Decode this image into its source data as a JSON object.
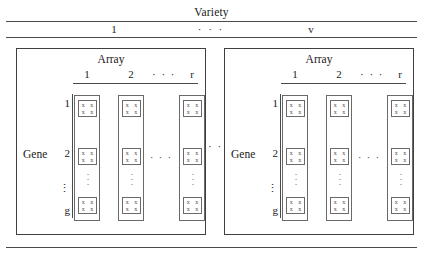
{
  "figure": {
    "top_heading": "Variety",
    "variety_columns": [
      "1",
      "· · ·",
      "v"
    ],
    "between_panels_ellipsis": "· · ·",
    "gene_axis_label": "Gene",
    "gene_ticks": [
      "1",
      "2",
      "⋮",
      "g"
    ],
    "array_heading": "Array",
    "array_columns": [
      "1",
      "2",
      "· · ·",
      "r"
    ],
    "array_column_ellipsis": "· · ·",
    "column_vertical_dots": [
      "·",
      "·",
      "·"
    ],
    "spot_marks": [
      "x",
      "x",
      "x",
      "x"
    ],
    "panels": [
      {
        "name": "variety-1",
        "array_heading": "Array"
      },
      {
        "name": "variety-v",
        "array_heading": "Array"
      }
    ],
    "colors": {
      "ink": "#1a1a1a",
      "rule": "#4a4a4a",
      "box_border": "#3f3f3f",
      "cell_border": "#6a6a6a",
      "background": "#ffffff"
    }
  }
}
